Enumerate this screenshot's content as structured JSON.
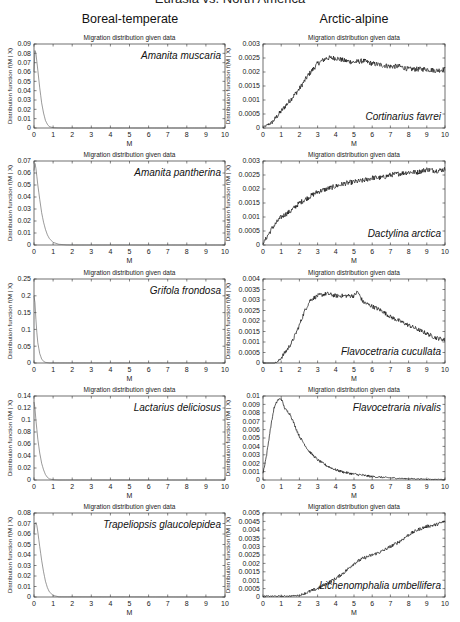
{
  "figure": {
    "super_title": "Eurasia vs. North America",
    "columns": [
      "Boreal-temperate",
      "Arctic-alpine"
    ]
  },
  "chart_data": [
    {
      "type": "line",
      "panel": "left-1",
      "title": "Migration distribution given data",
      "species": "Amanita muscaria",
      "species_pos": "top-right",
      "xlabel": "M",
      "ylabel": "Distribution function f(M | X)",
      "xlim": [
        0,
        10
      ],
      "ylim": [
        0,
        0.09
      ],
      "xticks": [
        0,
        1,
        2,
        3,
        4,
        5,
        6,
        7,
        8,
        9,
        10
      ],
      "yticks": [
        0,
        0.01,
        0.02,
        0.03,
        0.04,
        0.05,
        0.06,
        0.07,
        0.08,
        0.09
      ],
      "yticklabels": [
        "0",
        "0.01",
        "0.02",
        "0.03",
        "0.04",
        "0.05",
        "0.06",
        "0.07",
        "0.08",
        "0.09"
      ],
      "x": [
        0,
        0.05,
        0.1,
        0.2,
        0.3,
        0.4,
        0.5,
        0.6,
        0.7,
        0.8,
        1.0,
        1.5,
        10
      ],
      "y": [
        0.06,
        0.083,
        0.08,
        0.062,
        0.043,
        0.027,
        0.016,
        0.008,
        0.004,
        0.0015,
        0.0003,
        0,
        0
      ],
      "noise": 0
    },
    {
      "type": "line",
      "panel": "right-1",
      "title": "Migration distribution given data",
      "species": "Cortinarius favrei",
      "species_pos": "bottom-right",
      "xlabel": "M",
      "ylabel": "Distribution function f(M | X)",
      "xlim": [
        0,
        10
      ],
      "ylim": [
        0,
        0.003
      ],
      "xticks": [
        0,
        1,
        2,
        3,
        4,
        5,
        6,
        7,
        8,
        9,
        10
      ],
      "yticks": [
        0,
        0.0005,
        0.001,
        0.0015,
        0.002,
        0.0025,
        0.003
      ],
      "yticklabels": [
        "0",
        "0.0005",
        "0.001",
        "0.0015",
        "0.002",
        "0.0025",
        "0.003"
      ],
      "x": [
        0,
        0.5,
        1,
        1.5,
        2,
        2.5,
        3,
        3.5,
        4,
        4.5,
        5,
        5.5,
        6,
        6.5,
        7,
        7.5,
        8,
        8.5,
        9,
        9.5,
        10
      ],
      "y": [
        2e-05,
        0.0002,
        0.0006,
        0.001,
        0.0014,
        0.0019,
        0.0023,
        0.0025,
        0.0025,
        0.0024,
        0.00235,
        0.0024,
        0.0023,
        0.00225,
        0.0022,
        0.0022,
        0.0021,
        0.0021,
        0.0021,
        0.00205,
        0.0021
      ],
      "noise": 9e-05
    },
    {
      "type": "line",
      "panel": "left-2",
      "title": "Migration distribution given data",
      "species": "Amanita pantherina",
      "species_pos": "top-right",
      "xlabel": "M",
      "ylabel": "Distribution function f(M | X)",
      "xlim": [
        0,
        10
      ],
      "ylim": [
        0,
        0.07
      ],
      "xticks": [
        0,
        1,
        2,
        3,
        4,
        5,
        6,
        7,
        8,
        9,
        10
      ],
      "yticks": [
        0,
        0.01,
        0.02,
        0.03,
        0.04,
        0.05,
        0.06,
        0.07
      ],
      "yticklabels": [
        "0",
        "0.01",
        "0.02",
        "0.03",
        "0.04",
        "0.05",
        "0.06",
        "0.07"
      ],
      "x": [
        0,
        0.05,
        0.1,
        0.2,
        0.3,
        0.4,
        0.5,
        0.6,
        0.7,
        0.8,
        1.0,
        1.3,
        1.7,
        2.0,
        10
      ],
      "y": [
        0.062,
        0.068,
        0.064,
        0.05,
        0.038,
        0.027,
        0.019,
        0.013,
        0.0085,
        0.0055,
        0.0022,
        0.0006,
        0.0001,
        0,
        0
      ],
      "noise": 0
    },
    {
      "type": "line",
      "panel": "right-2",
      "title": "Migration distribution given data",
      "species": "Dactylina arctica",
      "species_pos": "bottom-right",
      "xlabel": "M",
      "ylabel": "Distribution function f(M | X)",
      "xlim": [
        0,
        10
      ],
      "ylim": [
        0,
        0.003
      ],
      "xticks": [
        0,
        1,
        2,
        3,
        4,
        5,
        6,
        7,
        8,
        9,
        10
      ],
      "yticks": [
        0,
        0.0005,
        0.001,
        0.0015,
        0.002,
        0.0025,
        0.003
      ],
      "yticklabels": [
        "0",
        "0.0005",
        "0.001",
        "0.0015",
        "0.002",
        "0.0025",
        "0.003"
      ],
      "x": [
        0,
        0.5,
        1,
        1.5,
        2,
        2.5,
        3,
        3.5,
        4,
        4.5,
        5,
        5.5,
        6,
        6.5,
        7,
        7.5,
        8,
        8.5,
        9,
        9.5,
        10
      ],
      "y": [
        5e-05,
        0.0006,
        0.001,
        0.0012,
        0.0015,
        0.0017,
        0.0019,
        0.002,
        0.0021,
        0.0022,
        0.00225,
        0.0023,
        0.0024,
        0.0024,
        0.0025,
        0.00255,
        0.0026,
        0.0026,
        0.0027,
        0.00265,
        0.0027
      ],
      "noise": 9e-05
    },
    {
      "type": "line",
      "panel": "left-3",
      "title": "Migration distribution given data",
      "species": "Grifola frondosa",
      "species_pos": "top-right",
      "xlabel": "M",
      "ylabel": "Distribution function f(M | X)",
      "xlim": [
        0,
        10
      ],
      "ylim": [
        0,
        0.25
      ],
      "xticks": [
        0,
        1,
        2,
        3,
        4,
        5,
        6,
        7,
        8,
        9,
        10
      ],
      "yticks": [
        0,
        0.05,
        0.1,
        0.15,
        0.2,
        0.25
      ],
      "yticklabels": [
        "0",
        "0.05",
        "0.1",
        "0.15",
        "0.2",
        "0.25"
      ],
      "x": [
        0,
        0.05,
        0.1,
        0.15,
        0.2,
        0.3,
        0.4,
        0.5,
        0.6,
        0.8,
        10
      ],
      "y": [
        0.2,
        0.18,
        0.13,
        0.09,
        0.06,
        0.028,
        0.012,
        0.005,
        0.002,
        0.0003,
        0
      ],
      "noise": 0
    },
    {
      "type": "line",
      "panel": "right-3",
      "title": "Migration distribution given data",
      "species": "Flavocetraria cucullata",
      "species_pos": "bottom-right",
      "xlabel": "M",
      "ylabel": "Distribution function f(M | X)",
      "xlim": [
        0,
        10
      ],
      "ylim": [
        0,
        0.004
      ],
      "xticks": [
        0,
        1,
        2,
        3,
        4,
        5,
        6,
        7,
        8,
        9,
        10
      ],
      "yticks": [
        0,
        0.0005,
        0.001,
        0.0015,
        0.002,
        0.0025,
        0.003,
        0.0035,
        0.004
      ],
      "yticklabels": [
        "0",
        "0.0005",
        "0.001",
        "0.0015",
        "0.002",
        "0.0025",
        "0.003",
        "0.0035",
        "0.004"
      ],
      "x": [
        0,
        0.6,
        0.8,
        1,
        1.3,
        1.6,
        2,
        2.3,
        2.6,
        3,
        3.5,
        4,
        4.5,
        5,
        5.2,
        5.5,
        6,
        6.5,
        7,
        7.5,
        8,
        8.5,
        9,
        9.5,
        10
      ],
      "y": [
        0,
        0,
        5e-05,
        0.00025,
        0.0006,
        0.001,
        0.0018,
        0.0025,
        0.003,
        0.0032,
        0.0033,
        0.0032,
        0.0032,
        0.0032,
        0.0034,
        0.0029,
        0.0027,
        0.0025,
        0.0022,
        0.002,
        0.0018,
        0.0016,
        0.0014,
        0.0012,
        0.0011
      ],
      "noise": 0.0001
    },
    {
      "type": "line",
      "panel": "left-4",
      "title": "Migration distribution given data",
      "species": "Lactarius deliciosus",
      "species_pos": "top-right",
      "xlabel": "M",
      "ylabel": "Distribution function f(M | X)",
      "xlim": [
        0,
        10
      ],
      "ylim": [
        0,
        0.14
      ],
      "xticks": [
        0,
        1,
        2,
        3,
        4,
        5,
        6,
        7,
        8,
        9,
        10
      ],
      "yticks": [
        0,
        0.02,
        0.04,
        0.06,
        0.08,
        0.1,
        0.12,
        0.14
      ],
      "yticklabels": [
        "0",
        "0.02",
        "0.04",
        "0.06",
        "0.08",
        "0.1",
        "0.12",
        "0.14"
      ],
      "x": [
        0,
        0.05,
        0.1,
        0.2,
        0.3,
        0.4,
        0.5,
        0.6,
        0.7,
        0.8,
        1.0,
        1.3,
        10
      ],
      "y": [
        0.13,
        0.12,
        0.1,
        0.068,
        0.045,
        0.028,
        0.017,
        0.009,
        0.0045,
        0.002,
        0.0004,
        0,
        0
      ],
      "noise": 0
    },
    {
      "type": "line",
      "panel": "right-4",
      "title": "Migration distribution given data",
      "species": "Flavocetraria nivalis",
      "species_pos": "top-right",
      "xlabel": "M",
      "ylabel": "Distribution function f(M | X)",
      "xlim": [
        0,
        10
      ],
      "ylim": [
        0,
        0.01
      ],
      "xticks": [
        0,
        1,
        2,
        3,
        4,
        5,
        6,
        7,
        8,
        9,
        10
      ],
      "yticks": [
        0,
        0.001,
        0.002,
        0.003,
        0.004,
        0.005,
        0.006,
        0.007,
        0.008,
        0.009,
        0.01
      ],
      "yticklabels": [
        "0",
        "0.001",
        "0.002",
        "0.003",
        "0.004",
        "0.005",
        "0.006",
        "0.007",
        "0.008",
        "0.009",
        "0.01"
      ],
      "x": [
        0,
        0.2,
        0.4,
        0.6,
        0.8,
        1.0,
        1.2,
        1.5,
        1.8,
        2,
        2.5,
        3,
        3.5,
        4,
        4.5,
        5,
        6,
        7,
        8,
        9,
        10
      ],
      "y": [
        0.0008,
        0.003,
        0.006,
        0.0085,
        0.0095,
        0.0097,
        0.0085,
        0.0078,
        0.0062,
        0.0052,
        0.0035,
        0.0024,
        0.0017,
        0.0012,
        0.0009,
        0.0007,
        0.0004,
        0.00025,
        0.00015,
        0.0001,
        6e-05
      ],
      "noise": 0.00015
    },
    {
      "type": "line",
      "panel": "left-5",
      "title": "Migration distribution given data",
      "species": "Trapeliopsis glaucolepidea",
      "species_pos": "top-right",
      "xlabel": "M",
      "ylabel": "Distribution function f(M | X)",
      "xlim": [
        0,
        10
      ],
      "ylim": [
        0,
        0.08
      ],
      "xticks": [
        0,
        1,
        2,
        3,
        4,
        5,
        6,
        7,
        8,
        9,
        10
      ],
      "yticks": [
        0,
        0.01,
        0.02,
        0.03,
        0.04,
        0.05,
        0.06,
        0.07,
        0.08
      ],
      "yticklabels": [
        "0",
        "0.01",
        "0.02",
        "0.03",
        "0.04",
        "0.05",
        "0.06",
        "0.07",
        "0.08"
      ],
      "x": [
        0,
        0.05,
        0.1,
        0.15,
        0.2,
        0.3,
        0.4,
        0.5,
        0.6,
        0.7,
        0.8,
        1.0,
        1.3,
        10
      ],
      "y": [
        0.06,
        0.069,
        0.071,
        0.068,
        0.062,
        0.048,
        0.035,
        0.024,
        0.015,
        0.009,
        0.005,
        0.0015,
        0.0002,
        0
      ],
      "noise": 0
    },
    {
      "type": "line",
      "panel": "right-5",
      "title": "Migration distribution given data",
      "species": "Lichenomphalia umbellifera",
      "species_pos": "bottom-right",
      "xlabel": "M",
      "ylabel": "Distribution function f(M | X)",
      "xlim": [
        0,
        10
      ],
      "ylim": [
        0,
        0.005
      ],
      "xticks": [
        0,
        1,
        2,
        3,
        4,
        5,
        6,
        7,
        8,
        9,
        10
      ],
      "yticks": [
        0,
        0.0005,
        0.001,
        0.0015,
        0.002,
        0.0025,
        0.003,
        0.0035,
        0.004,
        0.0045,
        0.005
      ],
      "yticklabels": [
        "0",
        "0.0005",
        "0.001",
        "0.0015",
        "0.002",
        "0.0025",
        "0.003",
        "0.0035",
        "0.004",
        "0.0045",
        "0.005"
      ],
      "x": [
        0,
        0.5,
        1,
        1.5,
        2,
        2.5,
        3,
        3.5,
        4,
        4.5,
        5,
        5.5,
        6,
        6.5,
        7,
        7.5,
        8,
        8.5,
        9,
        9.5,
        10
      ],
      "y": [
        5e-05,
        5e-05,
        5e-05,
        6e-05,
        0.0001,
        0.0003,
        0.0005,
        0.0008,
        0.0011,
        0.0015,
        0.002,
        0.0023,
        0.0025,
        0.0027,
        0.003,
        0.0033,
        0.0037,
        0.004,
        0.0042,
        0.0043,
        0.0045
      ],
      "noise": 0.0001
    }
  ]
}
